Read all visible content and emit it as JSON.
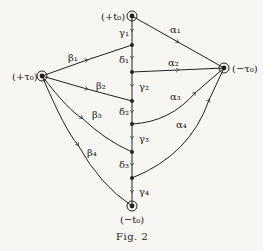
{
  "diagram": {
    "nodes": {
      "top": {
        "label": "(+t₀)"
      },
      "left": {
        "label": "(+τ₀)"
      },
      "right": {
        "label": "(−τ₀)"
      },
      "bottom": {
        "label": "(−t₀)"
      }
    },
    "edges": {
      "alpha": [
        "α₁",
        "α₂",
        "α₃",
        "α₄"
      ],
      "beta": [
        "β₁",
        "β₂",
        "β₃",
        "β₄"
      ],
      "gamma": [
        "γ₁",
        "γ₂",
        "γ₃",
        "γ₄"
      ],
      "delta": [
        "δ₁",
        "δ₂",
        "δ₃"
      ]
    },
    "caption": "Fig. 2",
    "colors": {
      "ink": "#222222",
      "paper": "#f7f6f3"
    }
  }
}
